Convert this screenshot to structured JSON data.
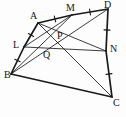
{
  "figure": {
    "name": "geometry-quadrilateral-midpoint-diagram",
    "width": 126,
    "height": 117,
    "background_color": "#fdfdfd",
    "stroke_color": "#1a1a1a",
    "label_color": "#141414",
    "tick_color": "#1a1a1a"
  },
  "points": [
    {
      "id": "A",
      "label": "A",
      "x": 38,
      "y": 23,
      "label_x": 30,
      "label_y": 11
    },
    {
      "id": "M",
      "label": "M",
      "x": 72,
      "y": 15,
      "label_x": 66,
      "label_y": 3
    },
    {
      "id": "D",
      "label": "D",
      "x": 108,
      "y": 9,
      "label_x": 104,
      "label_y": 0
    },
    {
      "id": "L",
      "label": "L",
      "x": 24,
      "y": 47,
      "label_x": 13,
      "label_y": 40
    },
    {
      "id": "P",
      "label": "P",
      "x": 57,
      "y": 40,
      "label_x": 57,
      "label_y": 31
    },
    {
      "id": "N",
      "label": "N",
      "x": 106,
      "y": 51,
      "label_x": 110,
      "label_y": 44
    },
    {
      "id": "Q",
      "label": "Q",
      "x": 48,
      "y": 54,
      "label_x": 43,
      "label_y": 50
    },
    {
      "id": "B",
      "label": "B",
      "x": 11,
      "y": 74,
      "label_x": 4,
      "label_y": 70
    },
    {
      "id": "C",
      "label": "C",
      "x": 112,
      "y": 97,
      "label_x": 113,
      "label_y": 98
    }
  ],
  "segments": [
    {
      "name": "side-A-M",
      "from": "A",
      "to": "M",
      "weight": "heavy"
    },
    {
      "name": "side-M-D",
      "from": "M",
      "to": "D",
      "weight": "heavy"
    },
    {
      "name": "side-A-L",
      "from": "A",
      "to": "L",
      "weight": "heavy"
    },
    {
      "name": "side-L-B",
      "from": "L",
      "to": "B",
      "weight": "heavy"
    },
    {
      "name": "side-D-N",
      "from": "D",
      "to": "N",
      "weight": "heavy"
    },
    {
      "name": "side-N-C",
      "from": "N",
      "to": "C",
      "weight": "heavy"
    },
    {
      "name": "side-B-C",
      "from": "B",
      "to": "C",
      "weight": "heavy"
    },
    {
      "name": "cevian-A-N",
      "from": "A",
      "to": "N",
      "weight": "light"
    },
    {
      "name": "cevian-A-C",
      "from": "A",
      "to": "C",
      "weight": "light"
    },
    {
      "name": "cevian-L-M",
      "from": "L",
      "to": "M",
      "weight": "light"
    },
    {
      "name": "cevian-L-N",
      "from": "L",
      "to": "N",
      "weight": "light"
    },
    {
      "name": "cevian-B-M",
      "from": "B",
      "to": "M",
      "weight": "light"
    },
    {
      "name": "cevian-B-D",
      "from": "B",
      "to": "D",
      "weight": "light"
    }
  ],
  "tick_marks": [
    {
      "name": "tick-A-M",
      "on": "side-A-M",
      "t": 0.5,
      "count": 1
    },
    {
      "name": "tick-M-D",
      "on": "side-M-D",
      "t": 0.5,
      "count": 1
    },
    {
      "name": "tick-A-L",
      "on": "side-A-L",
      "t": 0.5,
      "count": 1
    },
    {
      "name": "tick-L-B",
      "on": "side-L-B",
      "t": 0.5,
      "count": 1
    },
    {
      "name": "tick-D-N",
      "on": "side-D-N",
      "t": 0.5,
      "count": 1
    },
    {
      "name": "tick-N-C",
      "on": "side-N-C",
      "t": 0.5,
      "count": 1
    }
  ]
}
